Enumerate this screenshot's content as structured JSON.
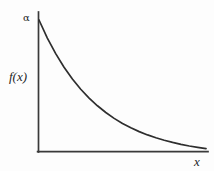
{
  "figure": {
    "background_color": "#fdfdfd",
    "line_color": "#2e2e2e",
    "axis_color": "#3a3a3a",
    "width": 214,
    "height": 171
  },
  "labels": {
    "y_intercept": "α",
    "y_axis": "f(x)",
    "x_axis": "x"
  },
  "chart_data": {
    "type": "line",
    "title": "",
    "subtitle": "",
    "xlabel": "x",
    "ylabel": "f(x)",
    "grid": false,
    "legend": null,
    "annotations": [
      {
        "text": "α",
        "x": 0,
        "y": 1.0,
        "note": "value of f(x) at x = 0, the y-intercept of the exponential density"
      }
    ],
    "xlim": [
      0,
      1
    ],
    "ylim": [
      0,
      1.08
    ],
    "axis_ticks": {
      "x": [],
      "y": []
    },
    "series": [
      {
        "name": "exponential decay f(x) = α e^(-α x)",
        "x": [
          0.0,
          0.05,
          0.1,
          0.15,
          0.2,
          0.25,
          0.3,
          0.35,
          0.4,
          0.45,
          0.5,
          0.55,
          0.6,
          0.65,
          0.7,
          0.75,
          0.8,
          0.85,
          0.9,
          0.95,
          1.0
        ],
        "y": [
          1.0,
          0.868,
          0.754,
          0.655,
          0.569,
          0.494,
          0.429,
          0.373,
          0.324,
          0.281,
          0.244,
          0.212,
          0.184,
          0.16,
          0.139,
          0.121,
          0.105,
          0.091,
          0.079,
          0.069,
          0.06
        ]
      }
    ]
  }
}
